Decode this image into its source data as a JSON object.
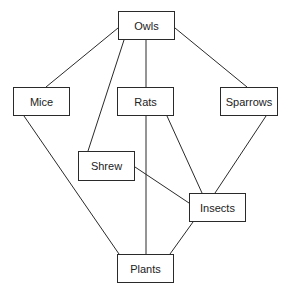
{
  "diagram": {
    "type": "food-web",
    "colors": {
      "line": "#2a2a2a",
      "box_border": "#2a2a2a",
      "text": "#222222",
      "background": "#ffffff"
    },
    "nodes": [
      {
        "id": "owls",
        "label": "Owls",
        "x": 118,
        "y": 11,
        "w": 57,
        "h": 29
      },
      {
        "id": "mice",
        "label": "Mice",
        "x": 13,
        "y": 87,
        "w": 57,
        "h": 29
      },
      {
        "id": "rats",
        "label": "Rats",
        "x": 117,
        "y": 87,
        "w": 57,
        "h": 29
      },
      {
        "id": "sparrows",
        "label": "Sparrows",
        "x": 220,
        "y": 87,
        "w": 58,
        "h": 29
      },
      {
        "id": "shrew",
        "label": "Shrew",
        "x": 78,
        "y": 151,
        "w": 57,
        "h": 30
      },
      {
        "id": "insects",
        "label": "Insects",
        "x": 189,
        "y": 193,
        "w": 57,
        "h": 29
      },
      {
        "id": "plants",
        "label": "Plants",
        "x": 117,
        "y": 254,
        "w": 57,
        "h": 29
      }
    ],
    "edges": [
      {
        "from": "owls",
        "to": "mice",
        "x1": 118,
        "y1": 28,
        "x2": 46,
        "y2": 87
      },
      {
        "from": "owls",
        "to": "shrew",
        "x1": 124,
        "y1": 40,
        "x2": 88,
        "y2": 151
      },
      {
        "from": "owls",
        "to": "rats",
        "x1": 146,
        "y1": 40,
        "x2": 146,
        "y2": 87
      },
      {
        "from": "owls",
        "to": "sparrows",
        "x1": 175,
        "y1": 28,
        "x2": 247,
        "y2": 87
      },
      {
        "from": "mice",
        "to": "plants",
        "x1": 24,
        "y1": 116,
        "x2": 119,
        "y2": 254
      },
      {
        "from": "rats",
        "to": "plants",
        "x1": 146,
        "y1": 116,
        "x2": 146,
        "y2": 254
      },
      {
        "from": "rats",
        "to": "insects",
        "x1": 167,
        "y1": 116,
        "x2": 202,
        "y2": 193
      },
      {
        "from": "sparrows",
        "to": "insects",
        "x1": 266,
        "y1": 116,
        "x2": 215,
        "y2": 193
      },
      {
        "from": "shrew",
        "to": "insects",
        "x1": 135,
        "y1": 167,
        "x2": 189,
        "y2": 203
      },
      {
        "from": "insects",
        "to": "plants",
        "x1": 193,
        "y1": 222,
        "x2": 170,
        "y2": 254
      }
    ]
  }
}
